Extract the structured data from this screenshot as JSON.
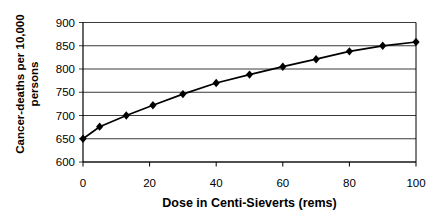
{
  "chart_data": {
    "type": "line",
    "title": "",
    "xlabel": "Dose in Centi-Sieverts (rems)",
    "ylabel": "Cancer-deaths per 10,000 persons",
    "ylabel_line1": "Cancer-deaths per 10,000",
    "ylabel_line2": "persons",
    "x": [
      0,
      5,
      13,
      21,
      30,
      40,
      50,
      60,
      70,
      80,
      90,
      100
    ],
    "y": [
      650,
      676,
      700,
      722,
      746,
      770,
      788,
      805,
      821,
      838,
      850,
      858
    ],
    "series_name": "Cancer deaths vs dose",
    "xlim": [
      0,
      100
    ],
    "ylim": [
      600,
      900
    ],
    "x_ticks": [
      0,
      20,
      40,
      60,
      80,
      100
    ],
    "y_ticks": [
      600,
      650,
      700,
      750,
      800,
      850,
      900
    ],
    "grid": "horizontal",
    "legend": "none",
    "marker": "diamond",
    "line_color": "#000000",
    "marker_color": "#000000",
    "grid_color": "#3a3a3a",
    "axis_color": "#000000",
    "background": "#ffffff",
    "tick_font_size": 11.5,
    "title_font_weight": "bold"
  }
}
